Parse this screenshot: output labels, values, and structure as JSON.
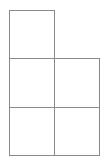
{
  "diagram": {
    "type": "grid-shape",
    "line_color": "#8a8a8a",
    "background": "#ffffff",
    "cells": [
      {
        "row": 0,
        "col": 0,
        "x": 9,
        "y": 10,
        "w": 46,
        "h": 49
      },
      {
        "row": 1,
        "col": 0,
        "x": 9,
        "y": 58,
        "w": 46,
        "h": 50
      },
      {
        "row": 1,
        "col": 1,
        "x": 54,
        "y": 58,
        "w": 46,
        "h": 50
      },
      {
        "row": 2,
        "col": 0,
        "x": 9,
        "y": 107,
        "w": 46,
        "h": 49
      },
      {
        "row": 2,
        "col": 1,
        "x": 54,
        "y": 107,
        "w": 46,
        "h": 49
      }
    ]
  }
}
